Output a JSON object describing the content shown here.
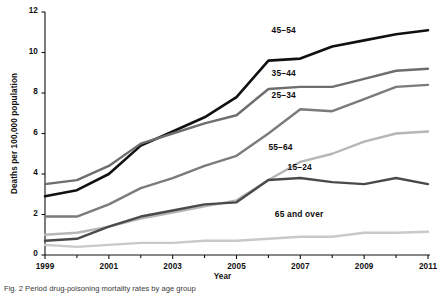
{
  "figure": {
    "caption": "Fig. 2   Period drug-poisoning mortality rates by age group"
  },
  "chart_data": {
    "type": "line",
    "title": "",
    "xlabel": "Year",
    "ylabel": "Deaths per 100,000 population",
    "xlim": [
      1999,
      2011
    ],
    "ylim": [
      0,
      12
    ],
    "grid": false,
    "legend_position": "inline-end-of-line",
    "x": [
      1999,
      2000,
      2001,
      2002,
      2003,
      2004,
      2005,
      2006,
      2007,
      2008,
      2009,
      2010,
      2011
    ],
    "x_tick_labels": [
      "1999",
      "2001",
      "2003",
      "2005",
      "2007",
      "2009",
      "2011"
    ],
    "x_ticks_major": [
      1999,
      2001,
      2003,
      2005,
      2007,
      2009,
      2011
    ],
    "x_ticks_minor": [
      2000,
      2002,
      2004,
      2006,
      2008,
      2010
    ],
    "y_tick_labels": [
      "0",
      "2",
      "4",
      "6",
      "8",
      "10",
      "12"
    ],
    "y_ticks": [
      0,
      2,
      4,
      6,
      8,
      10,
      12
    ],
    "series": [
      {
        "name": "45-54",
        "label": "45–54",
        "color": "#111111",
        "width": 2.6,
        "values": [
          2.9,
          3.2,
          4.0,
          5.4,
          6.1,
          6.8,
          7.8,
          9.6,
          9.7,
          10.3,
          10.6,
          10.9,
          11.1
        ]
      },
      {
        "name": "35-44",
        "label": "35–44",
        "color": "#6e6e6e",
        "width": 2.4,
        "values": [
          3.5,
          3.7,
          4.4,
          5.5,
          6.0,
          6.5,
          6.9,
          8.2,
          8.3,
          8.3,
          8.7,
          9.1,
          9.2
        ]
      },
      {
        "name": "25-34",
        "label": "25–34",
        "color": "#7b7b7b",
        "width": 2.4,
        "values": [
          1.9,
          1.9,
          2.5,
          3.3,
          3.8,
          4.4,
          4.9,
          6.0,
          7.2,
          7.1,
          7.7,
          8.3,
          8.4
        ]
      },
      {
        "name": "55-64",
        "label": "55–64",
        "color": "#b6b6b6",
        "width": 2.4,
        "values": [
          1.0,
          1.1,
          1.4,
          1.8,
          2.1,
          2.4,
          2.7,
          3.7,
          4.6,
          5.0,
          5.6,
          6.0,
          6.1
        ]
      },
      {
        "name": "15-24",
        "label": "15–24",
        "color": "#4a4a4a",
        "width": 2.4,
        "values": [
          0.7,
          0.8,
          1.4,
          1.9,
          2.2,
          2.5,
          2.6,
          3.7,
          3.8,
          3.6,
          3.5,
          3.8,
          3.5
        ]
      },
      {
        "name": "65 and over",
        "label": "65 and over",
        "color": "#c9c9c9",
        "width": 2.4,
        "values": [
          0.5,
          0.4,
          0.5,
          0.6,
          0.6,
          0.7,
          0.7,
          0.8,
          0.9,
          0.9,
          1.1,
          1.1,
          1.15
        ]
      }
    ],
    "series_label_positions": [
      {
        "series": "45-54",
        "x": 2006.1,
        "y": 11.05
      },
      {
        "series": "35-44",
        "x": 2006.1,
        "y": 8.95
      },
      {
        "series": "25-34",
        "x": 2006.1,
        "y": 7.85
      },
      {
        "series": "55-64",
        "x": 2006.0,
        "y": 5.3
      },
      {
        "series": "15-24",
        "x": 2006.6,
        "y": 4.3
      },
      {
        "series": "65 and over",
        "x": 2006.2,
        "y": 2.0
      }
    ]
  }
}
